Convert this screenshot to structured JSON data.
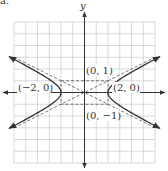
{
  "figure": {
    "part_label": "a.",
    "axis_label_y": "y",
    "labels": {
      "co_vertex_top": "(0, 1)",
      "co_vertex_bottom": "(0, −1)",
      "vertex_left": "(−2, 0)",
      "vertex_right": "(2, 0)"
    },
    "colors": {
      "grid": "#c8c8c8",
      "axis": "#333333",
      "curve": "#333333",
      "dashed": "#555555"
    }
  },
  "chart_data": {
    "type": "line",
    "title": "",
    "xlabel": "",
    "ylabel": "y",
    "xlim": [
      -6,
      6
    ],
    "ylim": [
      -6,
      6
    ],
    "grid": true,
    "equation": "x^2/4 - y^2 = 1",
    "vertices": [
      [
        -2,
        0
      ],
      [
        2,
        0
      ]
    ],
    "co_vertices": [
      [
        0,
        1
      ],
      [
        0,
        -1
      ]
    ],
    "asymptotes": [
      "y = x/2",
      "y = -x/2"
    ],
    "rectangle": {
      "x": [
        -2,
        2
      ],
      "y": [
        -1,
        1
      ],
      "style": "dashed"
    },
    "annotations": [
      "(0, 1)",
      "(0, −1)",
      "(−2, 0)",
      "(2, 0)"
    ]
  }
}
